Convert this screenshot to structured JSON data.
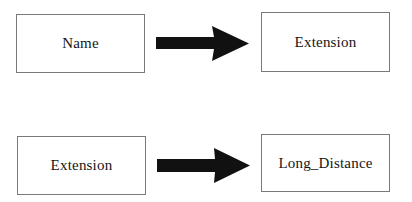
{
  "diagram": {
    "type": "mapping",
    "rows": [
      {
        "source": {
          "label": "Name"
        },
        "arrow": {
          "direction": "right"
        },
        "target": {
          "label": "Extension"
        }
      },
      {
        "source": {
          "label": "Extension"
        },
        "arrow": {
          "direction": "right"
        },
        "target": {
          "label": "Long_Distance"
        }
      }
    ],
    "colors": {
      "box_border": "#7a7a7a",
      "arrow_fill": "#111111",
      "text": "#151515",
      "background": "#ffffff"
    }
  }
}
